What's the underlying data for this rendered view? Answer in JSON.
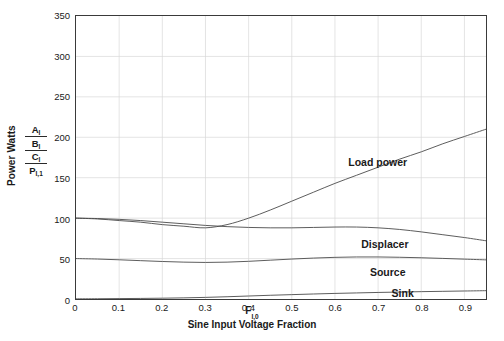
{
  "chart_data": {
    "type": "line",
    "title": "",
    "xlabel": "Sine Input Voltage Fraction",
    "xsymbol": "F",
    "xsymbol_sub": "I,0",
    "ylabel": "Power Watts",
    "ykeys": [
      "A",
      "B",
      "C",
      "P"
    ],
    "ykeys_sub": [
      "I",
      "I",
      "I",
      "I,1"
    ],
    "xlim": [
      0,
      0.95
    ],
    "ylim": [
      0,
      350
    ],
    "xticks": [
      0,
      0.1,
      0.2,
      0.3,
      0.4,
      0.5,
      0.6,
      0.7,
      0.8,
      0.9
    ],
    "xticklabels": [
      "0",
      "0.1",
      "0.2",
      "0.3",
      "0.4",
      "0.5",
      "0.6",
      "0.7",
      "0.8",
      "0.9"
    ],
    "yticks": [
      0,
      50,
      100,
      150,
      200,
      250,
      300,
      350
    ],
    "yticklabels": [
      "0",
      "50",
      "100",
      "150",
      "200",
      "250",
      "300",
      "350"
    ],
    "grid": true,
    "grid_color": "#d8d8d8",
    "axis_color": "#3a3a3a",
    "line_color": "#4a4a4a",
    "legend_position": "inline-annotations",
    "x": [
      0,
      0.05,
      0.1,
      0.15,
      0.2,
      0.25,
      0.3,
      0.35,
      0.4,
      0.45,
      0.5,
      0.55,
      0.6,
      0.65,
      0.7,
      0.75,
      0.8,
      0.85,
      0.9,
      0.95
    ],
    "series": [
      {
        "name": "Load power",
        "label": "Load power",
        "label_x": 0.63,
        "label_y": 168,
        "values": [
          100,
          99,
          97,
          95,
          92,
          90,
          88,
          92,
          100,
          110,
          121,
          132,
          143,
          153,
          163,
          173,
          182,
          192,
          201,
          210
        ]
      },
      {
        "name": "Displacer",
        "label": "Displacer",
        "label_x": 0.66,
        "label_y": 68,
        "values": [
          100,
          99.5,
          98.5,
          97,
          95,
          93,
          91,
          89.5,
          88.5,
          88,
          88,
          88.5,
          89,
          89,
          88,
          86,
          83,
          79.5,
          76,
          72
        ]
      },
      {
        "name": "Source",
        "label": "Source",
        "label_x": 0.68,
        "label_y": 33,
        "values": [
          50,
          49.4,
          48.5,
          47.4,
          46.4,
          45.6,
          45.2,
          45.6,
          46.6,
          48,
          49.4,
          50.6,
          51.5,
          52,
          52,
          51.6,
          51,
          50.2,
          49.3,
          48.4
        ]
      },
      {
        "name": "Sink",
        "label": "Sink",
        "label_x": 0.73,
        "label_y": 7,
        "values": [
          0.2,
          0.3,
          0.5,
          0.7,
          1,
          1.4,
          2,
          2.8,
          3.7,
          4.6,
          5.4,
          6.2,
          6.9,
          7.5,
          8.1,
          8.6,
          9.1,
          9.5,
          9.9,
          10.3
        ]
      }
    ]
  }
}
